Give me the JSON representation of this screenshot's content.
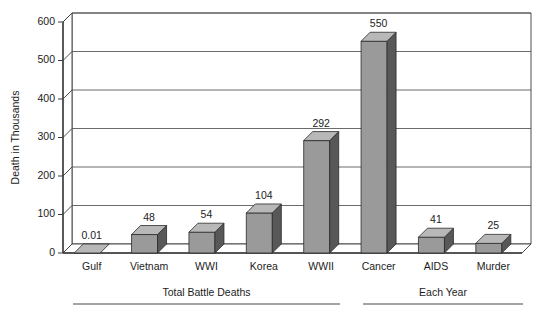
{
  "chart_data": {
    "type": "bar",
    "title": "",
    "subtitle": "",
    "xlabel": "",
    "ylabel": "Death in Thousands",
    "ylim": [
      0,
      600
    ],
    "ytick_values": [
      0,
      100,
      200,
      300,
      400,
      500,
      600
    ],
    "ytick_labels": [
      "0",
      "100",
      "200",
      "300",
      "400",
      "500",
      "600"
    ],
    "grid": true,
    "grid_orientation": "horizontal",
    "legend": null,
    "legend_position": "none",
    "three_d": true,
    "categories": [
      "Gulf",
      "Vietnam",
      "WWI",
      "Korea",
      "WWII",
      "Cancer",
      "AIDS",
      "Murder"
    ],
    "values": [
      0.01,
      48,
      54,
      104,
      292,
      550,
      41,
      25
    ],
    "value_labels": [
      "0.01",
      "48",
      "54",
      "104",
      "292",
      "550",
      "41",
      "25"
    ],
    "groups": [
      {
        "label": "Total Battle Deaths",
        "categories": [
          "Gulf",
          "Vietnam",
          "WWI",
          "Korea",
          "WWII"
        ]
      },
      {
        "label": "Each Year",
        "categories": [
          "Cancer",
          "AIDS",
          "Murder"
        ]
      }
    ],
    "colors": {
      "bar_front": "#9a9a9a",
      "bar_side": "#585858",
      "bar_top": "#b8b8b8",
      "axis": "#3a3a3a",
      "grid": "#5a5a5a",
      "text": "#1c1c1c",
      "background": "#ffffff"
    }
  }
}
